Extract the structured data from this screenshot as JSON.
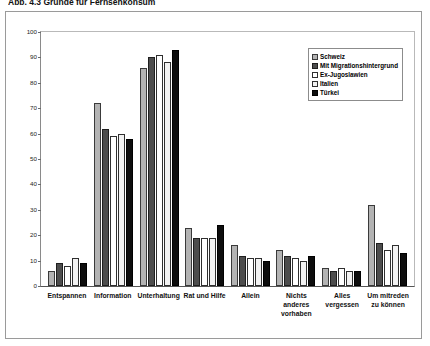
{
  "caption": "Abb. 4.3  Gründe für Fernsehkonsum",
  "chart_data": {
    "type": "bar",
    "title": "",
    "xlabel": "",
    "ylabel": "",
    "ylim": [
      0,
      100
    ],
    "ytick_step": 10,
    "yticks": [
      "100",
      "90",
      "80",
      "70",
      "60",
      "50",
      "40",
      "30",
      "20",
      "10",
      "0"
    ],
    "grid": false,
    "legend_position": "top-right",
    "categories": [
      "Entspannen",
      "Information",
      "Unterhaltung",
      "Rat und Hilfe",
      "Allein",
      "Nichts anderes vorhaben",
      "Alles vergessen",
      "Um mitreden zu können"
    ],
    "series": [
      {
        "name": "Schweiz",
        "color": "#b3b3b3",
        "values": [
          6,
          72,
          86,
          23,
          16,
          14,
          7,
          32
        ]
      },
      {
        "name": "Mit Migrationshintergrund",
        "color": "#4d4d4d",
        "values": [
          9,
          62,
          90,
          19,
          12,
          12,
          6,
          17
        ]
      },
      {
        "name": "Ex-Jugoslawien",
        "color": "#ffffff",
        "values": [
          8,
          59,
          91,
          19,
          11,
          11,
          7,
          14
        ]
      },
      {
        "name": "Italien",
        "color": "#f2f2f2",
        "values": [
          11,
          60,
          88,
          19,
          11,
          10,
          6,
          16
        ]
      },
      {
        "name": "Türkei",
        "color": "#0d0d0d",
        "values": [
          9,
          58,
          93,
          24,
          10,
          12,
          6,
          13
        ]
      }
    ]
  }
}
